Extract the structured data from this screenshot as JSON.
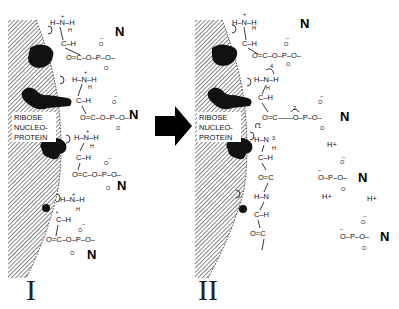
{
  "figure": {
    "panels": [
      {
        "id": "I",
        "label": "I",
        "surface_label": [
          "RIBOSE",
          "NUCLEO-",
          "PROTEIN"
        ],
        "units": [
          {
            "amine": "H-N-H",
            "charge": "+",
            "alpha": "C-H",
            "carbonyl": "O=C",
            "link": "O-P-O",
            "phosphate_charge": "-",
            "base": "N"
          },
          {
            "amine": "H-N-H",
            "charge": "+",
            "alpha": "C-H",
            "carbonyl": "O=C",
            "link": "O-P-O",
            "phosphate_charge": "-",
            "base": "N"
          },
          {
            "amine": "H-N-H",
            "charge": "+",
            "alpha": "C-H",
            "carbonyl": "O=C",
            "link": "O-P-O",
            "phosphate_charge": "-",
            "base": "N"
          },
          {
            "amine": "H-N-H",
            "charge": "+",
            "alpha": "C-H",
            "carbonyl": "O=C",
            "link": "O-P-O",
            "phosphate_charge": "-",
            "base": "N"
          }
        ]
      },
      {
        "id": "II",
        "label": "II",
        "surface_label": [
          "RIBOSE",
          "NUCLEO-",
          "PROTEIN"
        ],
        "arrow_numbers": [
          "1",
          "2",
          "3",
          "4"
        ],
        "free_species": [
          {
            "text": "H+"
          },
          {
            "text": "H+"
          },
          {
            "text": "H+"
          },
          {
            "text": "H+"
          },
          {
            "text": "O-P-O-N",
            "base": "N"
          },
          {
            "text": "O-P-O-N",
            "base": "N"
          }
        ]
      }
    ],
    "transition_arrow": "right-arrow",
    "atoms": {
      "N": "N",
      "H": "H",
      "C": "C",
      "O": "O",
      "P": "P",
      "plus": "+",
      "minus": "–"
    }
  }
}
